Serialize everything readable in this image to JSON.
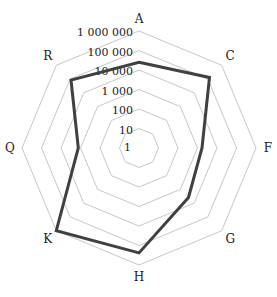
{
  "chart_data": {
    "type": "radar",
    "title": "",
    "scale": "log10",
    "categories": [
      "A",
      "C",
      "F",
      "G",
      "H",
      "K",
      "Q",
      "R"
    ],
    "series": [
      {
        "name": "series-1",
        "values": [
          25000,
          130000,
          1700,
          3900,
          240000,
          1000000,
          1300,
          85000
        ],
        "color": "#404040"
      }
    ],
    "radial_ticks": [
      "1",
      "10",
      "100",
      "1 000",
      "10 000",
      "100 000",
      "1 000 000"
    ],
    "radial_range": [
      1,
      1000000
    ],
    "grid": true,
    "grid_color": "#c8c8c8",
    "legend": "none"
  }
}
